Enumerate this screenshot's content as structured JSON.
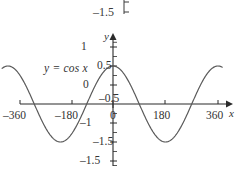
{
  "figure": {
    "equation_label": "y = cos x",
    "axis_labels": {
      "x": "x",
      "y": "y"
    },
    "stray_top_label": "–1.5"
  },
  "chart_data": {
    "type": "line",
    "title": "",
    "subtitle": "",
    "xlabel": "x",
    "ylabel": "y",
    "annotations": [
      "y = cos x",
      "–1.5"
    ],
    "legend": [],
    "legend_position": "none",
    "grid": false,
    "xlim": [
      -390,
      400
    ],
    "ylim": [
      -1.75,
      1.75
    ],
    "xticks": [
      -360,
      -180,
      0,
      180,
      360
    ],
    "xticklabels": [
      "–360",
      "–180",
      "0",
      "180",
      "360"
    ],
    "yticks": [
      -1.5,
      -1,
      -0.5,
      0,
      0.5,
      1,
      1.5
    ],
    "yticklabels": [
      "–1.5",
      "–1",
      "–0.5",
      "0",
      "0.5",
      "1",
      "1.5"
    ],
    "y_minor_tick_step": 0.25,
    "series": [
      {
        "name": "y = cos x",
        "color": "#5a5a5a",
        "function": "cos",
        "amplitude": 1,
        "period_degrees": 360,
        "x_start": -380,
        "x_end": 375,
        "points": [
          {
            "x": -360,
            "y": 1
          },
          {
            "x": -315,
            "y": 0.707
          },
          {
            "x": -270,
            "y": 0
          },
          {
            "x": -225,
            "y": -0.707
          },
          {
            "x": -180,
            "y": -1
          },
          {
            "x": -135,
            "y": -0.707
          },
          {
            "x": -90,
            "y": 0
          },
          {
            "x": -45,
            "y": 0.707
          },
          {
            "x": 0,
            "y": 1
          },
          {
            "x": 45,
            "y": 0.707
          },
          {
            "x": 90,
            "y": 0
          },
          {
            "x": 135,
            "y": -0.707
          },
          {
            "x": 180,
            "y": -1
          },
          {
            "x": 225,
            "y": -0.707
          },
          {
            "x": 270,
            "y": 0
          },
          {
            "x": 315,
            "y": 0.707
          },
          {
            "x": 360,
            "y": 1
          }
        ]
      }
    ],
    "colors": {
      "curve": "#5a5a5a",
      "axis": "#2b2b2b",
      "text": "#333333"
    }
  }
}
